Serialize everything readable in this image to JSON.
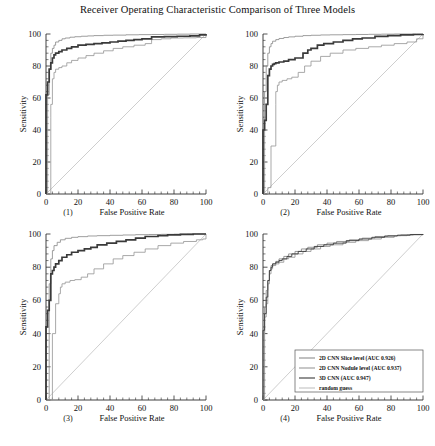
{
  "figure": {
    "title": "Receiver Operating Characteristic Comparison of Three Models",
    "axis_labels": {
      "x": "False Positive Rate",
      "y": "Sensitivity"
    },
    "panel_labels": [
      "(1)",
      "(2)",
      "(3)",
      "(4)"
    ]
  },
  "legend": {
    "position": "lower-right of panel (4)",
    "entries": [
      {
        "label": "2D CNN Slice level (AUC 0.926)",
        "color": "#8c8c8c"
      },
      {
        "label": "2D CNN Nodule level (AUC 0.937)",
        "color": "#9a9a9a"
      },
      {
        "label": "3D CNN (AUC 0.947)",
        "color": "#3a3a3a"
      },
      {
        "label": "random guess",
        "color": "#c2c2c2"
      }
    ]
  },
  "chart_data": {
    "type": "line",
    "title": "Receiver Operating Characteristic Comparison of Three Models",
    "xlabel": "False Positive Rate",
    "ylabel": "Sensitivity",
    "xlim": [
      0,
      100
    ],
    "ylim": [
      0,
      100
    ],
    "xticks": [
      0,
      20,
      40,
      60,
      80,
      100
    ],
    "yticks": [
      0,
      20,
      40,
      60,
      80,
      100
    ],
    "minor_ticks_per_interval": 4,
    "grid": false,
    "legend_position": "lower right",
    "panels": [
      {
        "name": "(1)",
        "series": [
          {
            "name": "2D CNN Slice level (AUC 0.926)",
            "color": "#8c8c8c",
            "width": 0.85,
            "x": [
              0,
              1,
              1,
              2,
              2,
              3,
              3,
              4,
              5,
              6,
              8,
              10,
              12,
              15,
              18,
              22,
              26,
              30,
              36,
              42,
              50,
              58,
              66,
              74,
              82,
              90,
              96,
              100
            ],
            "y": [
              0,
              0,
              62,
              62,
              78,
              78,
              88,
              91,
              93,
              95,
              96,
              97,
              97.5,
              98,
              98.3,
              98.6,
              98.8,
              99,
              99.2,
              99.3,
              99.5,
              99.6,
              99.7,
              99.8,
              99.9,
              100,
              100,
              100
            ]
          },
          {
            "name": "2D CNN Nodule level (AUC 0.937)",
            "color": "#9a9a9a",
            "width": 0.85,
            "x": [
              0,
              2,
              3,
              3,
              4,
              4,
              5,
              6,
              8,
              10,
              13,
              16,
              20,
              25,
              30,
              36,
              42,
              48,
              55,
              62,
              66,
              66,
              72,
              78,
              78,
              86,
              94,
              100
            ],
            "y": [
              0,
              0,
              48,
              56,
              56,
              72,
              76,
              78,
              79,
              80,
              82,
              83.5,
              85,
              86.5,
              88,
              89.5,
              91,
              92,
              93,
              94,
              94.5,
              96.5,
              97,
              97,
              97.5,
              97.6,
              97.8,
              100
            ]
          },
          {
            "name": "3D CNN (AUC 0.947)",
            "color": "#3a3a3a",
            "width": 1.7,
            "x": [
              0,
              0,
              1,
              1,
              2,
              2,
              3,
              4,
              5,
              6,
              8,
              10,
              13,
              16,
              20,
              25,
              30,
              35,
              40,
              45,
              50,
              55,
              60,
              66,
              66,
              74,
              82,
              90,
              96,
              100
            ],
            "y": [
              0,
              62,
              62,
              70,
              70,
              78,
              82,
              85,
              87,
              88,
              89,
              90,
              91,
              92,
              93,
              93.5,
              94,
              94.5,
              95,
              95.5,
              96,
              96.5,
              97,
              97.2,
              98.2,
              98.4,
              98.6,
              98.8,
              99.4,
              100
            ]
          }
        ]
      },
      {
        "name": "(2)",
        "series": [
          {
            "name": "2D CNN Slice level (AUC 0.926)",
            "color": "#8c8c8c",
            "width": 0.85,
            "x": [
              0,
              1,
              1,
              2,
              3,
              4,
              5,
              6,
              8,
              10,
              13,
              16,
              20,
              25,
              30,
              36,
              42,
              50,
              58,
              66,
              74,
              82,
              90,
              96,
              100
            ],
            "y": [
              0,
              0,
              64,
              80,
              88,
              92,
              94,
              95.5,
              96.5,
              97.2,
              97.8,
              98.2,
              98.6,
              99,
              99.2,
              99.4,
              99.5,
              99.6,
              99.7,
              99.8,
              99.9,
              100,
              100,
              100,
              100
            ]
          },
          {
            "name": "2D CNN Nodule level (AUC 0.937)",
            "color": "#9a9a9a",
            "width": 0.85,
            "x": [
              0,
              3,
              3,
              5,
              5,
              7,
              8,
              8,
              9,
              10,
              12,
              15,
              18,
              22,
              26,
              30,
              36,
              42,
              50,
              58,
              66,
              74,
              82,
              90,
              96,
              100
            ],
            "y": [
              0,
              0,
              4,
              4,
              30,
              30,
              56,
              64,
              68,
              70,
              71,
              72,
              73,
              76,
              80,
              83,
              86,
              88,
              90,
              91,
              92,
              93,
              94,
              95,
              97,
              100
            ]
          },
          {
            "name": "3D CNN (AUC 0.947)",
            "color": "#3a3a3a",
            "width": 1.7,
            "x": [
              0,
              0,
              1,
              1,
              2,
              2,
              3,
              3,
              4,
              5,
              6,
              7,
              8,
              10,
              13,
              16,
              20,
              25,
              28,
              30,
              34,
              38,
              44,
              50,
              56,
              62,
              70,
              78,
              86,
              94,
              100
            ],
            "y": [
              0,
              40,
              40,
              46,
              46,
              56,
              56,
              74,
              78,
              80,
              81,
              81.5,
              82,
              82.5,
              83,
              84,
              85,
              88,
              90,
              91,
              93,
              94,
              95,
              96,
              97,
              97.5,
              98.5,
              99,
              99.4,
              99.7,
              100
            ]
          }
        ]
      },
      {
        "name": "(3)",
        "series": [
          {
            "name": "2D CNN Slice level (AUC 0.926)",
            "color": "#8c8c8c",
            "width": 0.85,
            "x": [
              0,
              1,
              2,
              3,
              4,
              5,
              7,
              9,
              12,
              16,
              20,
              26,
              32,
              40,
              48,
              56,
              64,
              72,
              80,
              88,
              94,
              100
            ],
            "y": [
              0,
              0,
              70,
              85,
              90,
              93,
              95,
              96.5,
              97.4,
              98,
              98.4,
              98.8,
              99,
              99.2,
              99.4,
              99.6,
              99.7,
              99.8,
              99.9,
              100,
              100,
              100
            ]
          },
          {
            "name": "2D CNN Nodule level (AUC 0.937)",
            "color": "#9a9a9a",
            "width": 0.85,
            "x": [
              0,
              4,
              4,
              6,
              6,
              8,
              9,
              10,
              12,
              15,
              18,
              22,
              26,
              30,
              36,
              42,
              48,
              55,
              62,
              70,
              78,
              86,
              94,
              98,
              100
            ],
            "y": [
              0,
              0,
              40,
              40,
              58,
              64,
              68,
              70,
              71,
              72,
              72.5,
              74,
              76,
              79,
              82,
              85,
              87,
              89,
              91,
              93,
              94.5,
              95.5,
              96.5,
              97,
              100
            ]
          },
          {
            "name": "3D CNN (AUC 0.947)",
            "color": "#3a3a3a",
            "width": 1.7,
            "x": [
              0,
              0,
              1,
              1,
              2,
              2,
              3,
              3,
              4,
              5,
              6,
              8,
              10,
              13,
              16,
              20,
              24,
              28,
              32,
              38,
              44,
              50,
              56,
              62,
              70,
              76,
              84,
              92,
              100
            ],
            "y": [
              0,
              44,
              44,
              54,
              54,
              60,
              60,
              76,
              78,
              80,
              82,
              84,
              86,
              87.5,
              89,
              90,
              91,
              92,
              93.5,
              94.5,
              95.5,
              96.5,
              97.5,
              98.5,
              99,
              99.5,
              99.8,
              100,
              100
            ]
          }
        ]
      },
      {
        "name": "(4)",
        "series": [
          {
            "name": "2D CNN Slice level (AUC 0.926)",
            "color": "#8c8c8c",
            "width": 0.9,
            "x": [
              0,
              1,
              1,
              2,
              2,
              3,
              4,
              5,
              6,
              8,
              10,
              13,
              16,
              20,
              24,
              28,
              34,
              40,
              46,
              54,
              62,
              70,
              78,
              86,
              94,
              100
            ],
            "y": [
              0,
              0,
              56,
              56,
              66,
              72,
              78,
              81,
              82,
              83.5,
              85,
              86.5,
              88,
              89.5,
              91,
              92,
              93.5,
              94.5,
              95.5,
              96.5,
              97.5,
              98.5,
              99,
              99.4,
              99.7,
              100
            ]
          },
          {
            "name": "2D CNN Nodule level (AUC 0.937)",
            "color": "#9a9a9a",
            "width": 0.9,
            "x": [
              0,
              0,
              1,
              1,
              2,
              2,
              3,
              3,
              4,
              5,
              6,
              8,
              10,
              13,
              16,
              20,
              25,
              30,
              36,
              42,
              50,
              58,
              66,
              74,
              82,
              90,
              100
            ],
            "y": [
              0,
              40,
              40,
              50,
              54,
              58,
              62,
              70,
              76,
              79,
              81,
              82,
              83,
              85,
              86,
              88,
              89.5,
              91,
              92.5,
              93.5,
              95,
              96,
              97,
              98,
              99,
              99.5,
              100
            ]
          },
          {
            "name": "3D CNN (AUC 0.947)",
            "color": "#3a3a3a",
            "width": 0.9,
            "x": [
              0,
              0,
              1,
              2,
              2,
              3,
              3,
              4,
              5,
              6,
              8,
              10,
              12,
              15,
              18,
              22,
              27,
              32,
              38,
              44,
              52,
              60,
              68,
              76,
              84,
              92,
              100
            ],
            "y": [
              0,
              42,
              52,
              56,
              62,
              66,
              72,
              78,
              80,
              82,
              83,
              84,
              85,
              86.5,
              88,
              89.5,
              91,
              92.5,
              93.5,
              94.5,
              96,
              97,
              98,
              98.8,
              99.3,
              99.7,
              100
            ]
          }
        ]
      }
    ],
    "chance_line": {
      "name": "random guess",
      "color": "#c2c2c2",
      "x": [
        0,
        100
      ],
      "y": [
        0,
        100
      ]
    }
  }
}
